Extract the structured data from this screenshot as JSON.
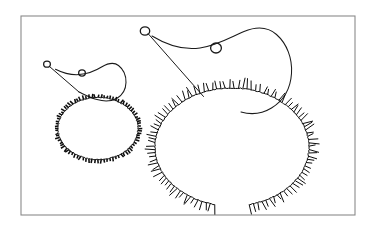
{
  "figure": {
    "background_color": "#ffffff",
    "ink_color": "#1a1a1a",
    "frame": {
      "name": "figure-border",
      "stroke_color": "#8a8a8a",
      "x": 21,
      "y": 16,
      "width": 334,
      "height": 199
    },
    "shapes": [
      {
        "id": "small-duck",
        "label": "small duck contour",
        "scale": "small",
        "head": {
          "label": "head outline",
          "path": "M 55.5 69.2 C 62 72.5 70 75.2 79 74.6 C 88 74.0 96 70.5 102 66.8 C 108.5 63.0 114 62.0 118.5 65.5 C 123.5 69.4 126.2 76.0 126.0 82.5 C 125.8 89.5 122.5 95.0 117.0 98.2 C 111.5 101.4 104.0 101.6 97.0 99.6 C 90.5 97.8 84.5 94.6 79.0 92.0"
        },
        "eye": {
          "label": "eye",
          "cx": 82.0,
          "cy": 73.0,
          "r": 3.1
        },
        "pointer": {
          "label": "beak pointer line",
          "x1": 49.5,
          "y1": 66.5,
          "x2": 79.0,
          "y2": 92.0
        },
        "tip_circle": {
          "label": "pointer tip circle",
          "cx": 47.0,
          "cy": 64.2,
          "r": 3.0
        },
        "body": {
          "label": "body ring with outward ticks",
          "cx": 98.0,
          "cy": 128.5,
          "rx": 40.0,
          "ry": 31.0,
          "closed": true,
          "tick_count": 84,
          "tick_length": 3.6,
          "arc_start_deg": 0,
          "arc_end_deg": 360
        }
      },
      {
        "id": "large-duck",
        "label": "large duck contour",
        "scale": "large",
        "head": {
          "label": "head outline",
          "path": "M 152.0 36.0 C 166 44.5 183 50.5 200 48.0 C 217 45.5 232 36.5 244 31.5 C 256.5 26.3 268 27.0 276.5 34.5 C 287 43.8 292.5 58.5 291.5 73.5 C 290.5 89.0 283.0 101.0 271.5 108.0 C 262.0 113.8 251.0 114.8 241.0 112.0"
        },
        "eye": {
          "label": "eye",
          "cx": 216.0,
          "cy": 48.0,
          "r": 5.0
        },
        "pointer": {
          "label": "beak pointer line",
          "x1": 148.0,
          "y1": 33.5,
          "x2": 203.5,
          "y2": 96.5
        },
        "tip_circle": {
          "label": "pointer tip circle",
          "cx": 145.0,
          "cy": 31.0,
          "r": 4.2
        },
        "body": {
          "label": "body arc with outward ticks",
          "cx": 232.0,
          "cy": 147.0,
          "rx": 77.0,
          "ry": 59.0,
          "closed": false,
          "tick_count": 104,
          "tick_length": 8.5,
          "arc_start_deg": 103,
          "arc_end_deg": 437
        }
      }
    ]
  }
}
